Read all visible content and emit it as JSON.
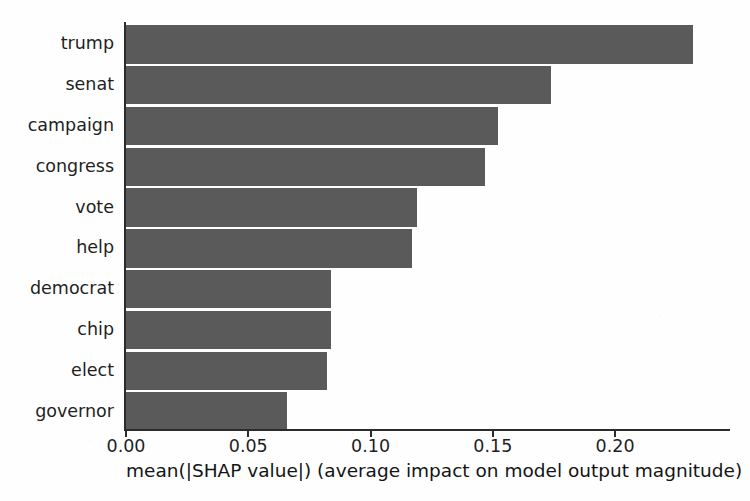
{
  "chart_data": {
    "type": "bar",
    "orientation": "horizontal",
    "title": "",
    "xlabel": "mean(|SHAP value|) (average impact on model output magnitude)",
    "ylabel": "",
    "categories": [
      "trump",
      "senat",
      "campaign",
      "congress",
      "vote",
      "help",
      "democrat",
      "chip",
      "elect",
      "governor"
    ],
    "values": [
      0.232,
      0.174,
      0.152,
      0.147,
      0.119,
      0.117,
      0.084,
      0.084,
      0.082,
      0.066
    ],
    "xlim": [
      0.0,
      0.247
    ],
    "ylim": [
      0,
      10
    ],
    "xticks": [
      0.0,
      0.05,
      0.1,
      0.15,
      0.2
    ],
    "xticklabels": [
      "0.00",
      "0.05",
      "0.10",
      "0.15",
      "0.20"
    ],
    "grid": false,
    "legend": false,
    "bar_color": "#5a5a5a",
    "axis_color": "#2b2b2b",
    "background": "#ffffff"
  }
}
